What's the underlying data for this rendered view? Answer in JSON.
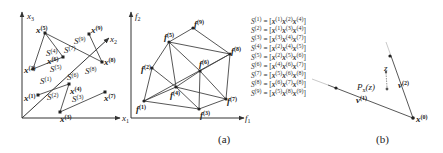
{
  "figure": {
    "panel_a": {
      "caption": "(a)",
      "left_plot": {
        "axes": {
          "x1": "x",
          "x2": "x",
          "x3": "x",
          "x1_sub": "1",
          "x2_sub": "2",
          "x3_sub": "3"
        },
        "points": [
          {
            "label": "x",
            "sup": "(1)",
            "x": 38,
            "y": 95
          },
          {
            "label": "x",
            "sup": "(2)",
            "x": 33,
            "y": 69
          },
          {
            "label": "x",
            "sup": "(3)",
            "x": 60,
            "y": 112
          },
          {
            "label": "x",
            "sup": "(4)",
            "x": 69,
            "y": 84
          },
          {
            "label": "x",
            "sup": "(5)",
            "x": 45,
            "y": 33
          },
          {
            "label": "x",
            "sup": "(6)",
            "x": 63,
            "y": 57
          },
          {
            "label": "x",
            "sup": "(7)",
            "x": 105,
            "y": 92
          },
          {
            "label": "x",
            "sup": "(8)",
            "x": 102,
            "y": 62
          },
          {
            "label": "x",
            "sup": "(9)",
            "x": 89,
            "y": 34
          }
        ],
        "simplex_labels": [
          {
            "text": "S",
            "sup": "(1)",
            "x": 40,
            "y": 82
          },
          {
            "text": "S",
            "sup": "(2)",
            "x": 50,
            "y": 99
          },
          {
            "text": "S",
            "sup": "(3)",
            "x": 73,
            "y": 101
          },
          {
            "text": "S",
            "sup": "(4)",
            "x": 48,
            "y": 53
          },
          {
            "text": "S",
            "sup": "(5)",
            "x": 48,
            "y": 70
          },
          {
            "text": "S",
            "sup": "(6)",
            "x": 70,
            "y": 77
          },
          {
            "text": "S",
            "sup": "(7)",
            "x": 60,
            "y": 50
          },
          {
            "text": "S",
            "sup": "(8)",
            "x": 87,
            "y": 71
          },
          {
            "text": "S",
            "sup": "(9)",
            "x": 76,
            "y": 41
          }
        ]
      },
      "right_plot": {
        "axes": {
          "f1": "f",
          "f2": "f",
          "f1_sub": "1",
          "f2_sub": "2"
        },
        "points": [
          {
            "label": "f",
            "sup": "(1)",
            "x": 144,
            "y": 101
          },
          {
            "label": "f",
            "sup": "(2)",
            "x": 152,
            "y": 68
          },
          {
            "label": "f",
            "sup": "(3)",
            "x": 199,
            "y": 109
          },
          {
            "label": "f",
            "sup": "(4)",
            "x": 176,
            "y": 87
          },
          {
            "label": "f",
            "sup": "(5)",
            "x": 169,
            "y": 42
          },
          {
            "label": "f",
            "sup": "(6)",
            "x": 200,
            "y": 71
          },
          {
            "label": "f",
            "sup": "(7)",
            "x": 226,
            "y": 99
          },
          {
            "label": "f",
            "sup": "(8)",
            "x": 230,
            "y": 54
          },
          {
            "label": "f",
            "sup": "(9)",
            "x": 193,
            "y": 28
          }
        ]
      },
      "simplex_list": [
        {
          "name": "S",
          "sup": "(1)",
          "verts": [
            "(1)",
            "(2)",
            "(4)"
          ]
        },
        {
          "name": "S",
          "sup": "(2)",
          "verts": [
            "(1)",
            "(3)",
            "(4)"
          ]
        },
        {
          "name": "S",
          "sup": "(3)",
          "verts": [
            "(3)",
            "(4)",
            "(7)"
          ]
        },
        {
          "name": "S",
          "sup": "(4)",
          "verts": [
            "(2)",
            "(4)",
            "(5)"
          ]
        },
        {
          "name": "S",
          "sup": "(5)",
          "verts": [
            "(2)",
            "(5)",
            "(6)"
          ]
        },
        {
          "name": "S",
          "sup": "(6)",
          "verts": [
            "(4)",
            "(6)",
            "(7)"
          ]
        },
        {
          "name": "S",
          "sup": "(7)",
          "verts": [
            "(5)",
            "(6)",
            "(8)"
          ]
        },
        {
          "name": "S",
          "sup": "(8)",
          "verts": [
            "(6)",
            "(7)",
            "(8)"
          ]
        },
        {
          "name": "S",
          "sup": "(9)",
          "verts": [
            "(5)",
            "(8)",
            "(9)"
          ]
        }
      ]
    },
    "panel_b": {
      "caption": "(b)",
      "labels": {
        "x0": "x",
        "x0_sup": "(0)",
        "v1": "v",
        "v1_sup": "(1)",
        "v2": "v",
        "v2_sup": "(2)",
        "pz": "P",
        "pz_sub": "x",
        "pz_rest": "(z)",
        "z": "z"
      }
    }
  }
}
